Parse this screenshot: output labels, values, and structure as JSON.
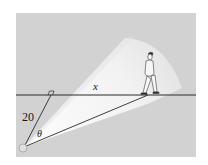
{
  "diagram": {
    "type": "geometry-illustration",
    "labels": {
      "x": "x",
      "perpendicular_distance": "20",
      "angle": "θ"
    },
    "colors": {
      "background_panel": "#d2d2d2",
      "beam": "#f3f3f3",
      "lines": "#2a2a2a",
      "outer_background": "#ffffff"
    },
    "elements": [
      {
        "name": "path-line",
        "kind": "horizontal line"
      },
      {
        "name": "perpendicular-line",
        "kind": "line of length 20 from light source to path, with right-angle marker"
      },
      {
        "name": "beam-line",
        "kind": "line from light source to the walker's feet"
      },
      {
        "name": "light-source",
        "kind": "circle"
      },
      {
        "name": "walker",
        "kind": "person walking along the path"
      },
      {
        "name": "light-cone",
        "kind": "bright wedge of light"
      }
    ]
  }
}
